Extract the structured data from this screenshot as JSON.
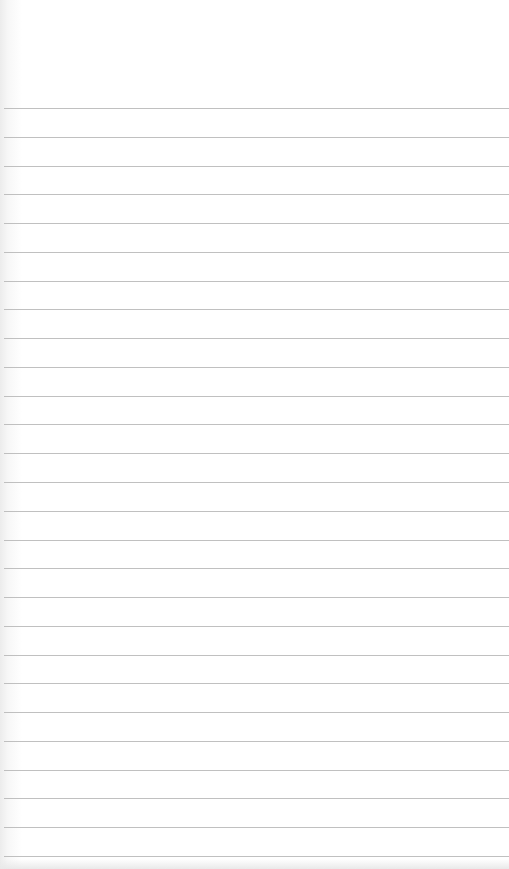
{
  "paper": {
    "type": "lined-paper",
    "background_color": "#ffffff",
    "line_color": "#b5b5b5",
    "first_line_y": 108,
    "line_spacing": 28.77,
    "line_count": 27
  }
}
